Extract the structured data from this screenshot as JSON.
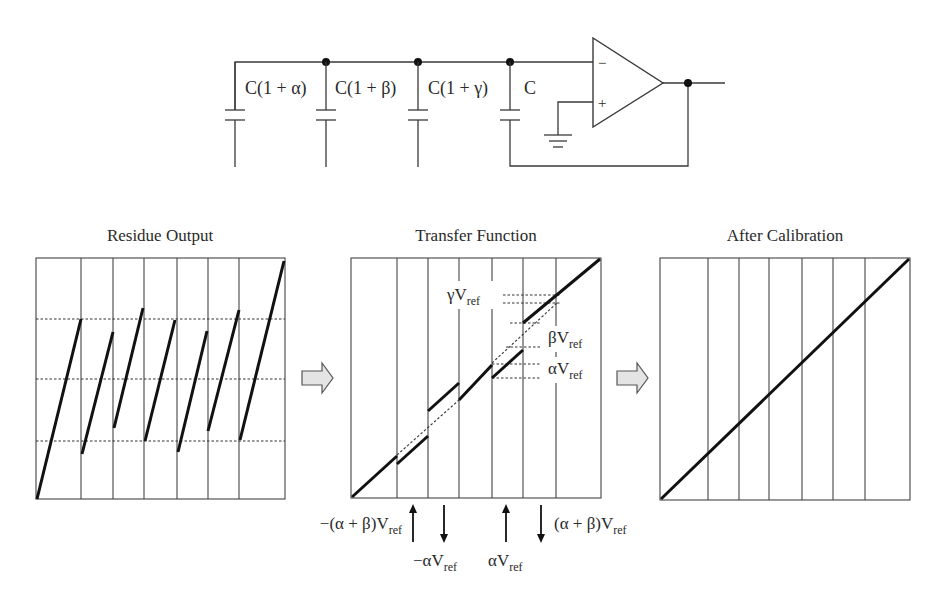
{
  "circuit": {
    "capacitors": [
      {
        "label": "C(1 + α)",
        "x": 235
      },
      {
        "label": "C(1 + β)",
        "x": 326
      },
      {
        "label": "C(1 + γ)",
        "x": 418
      },
      {
        "label": "C",
        "x": 510
      }
    ],
    "opamp": {
      "minus_label": "−",
      "plus_label": "+"
    }
  },
  "panels": [
    {
      "id": "residue",
      "title": "Residue  Output"
    },
    {
      "id": "transfer",
      "title": "Transfer Function"
    },
    {
      "id": "calibrated",
      "title": "After Calibration"
    }
  ],
  "transfer_annotations": {
    "gamma": {
      "prefix": "γV",
      "sub": "ref"
    },
    "beta": {
      "prefix": "βV",
      "sub": "ref"
    },
    "alpha": {
      "prefix": "αV",
      "sub": "ref"
    }
  },
  "axis_annotations": [
    {
      "prefix": "−(α + β)V",
      "sub": "ref",
      "direction": "up"
    },
    {
      "prefix": "−αV",
      "sub": "ref",
      "direction": "down"
    },
    {
      "prefix": "αV",
      "sub": "ref",
      "direction": "up"
    },
    {
      "prefix": "(α + β)V",
      "sub": "ref",
      "direction": "down"
    }
  ],
  "colors": {
    "line": "#111111",
    "arrow_fill": "#e4e4e4",
    "background": "#ffffff"
  }
}
